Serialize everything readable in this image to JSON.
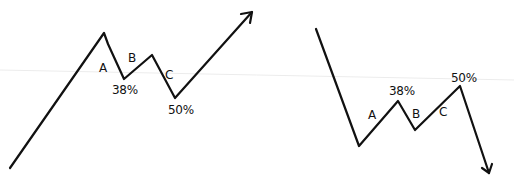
{
  "colors": {
    "ink": "#111111",
    "background": "#ffffff",
    "guide_line": "#e6e6e6"
  },
  "diagrams": [
    {
      "name": "bullish-abc-correction",
      "direction": "up",
      "labels": {
        "a": "A",
        "b": "B",
        "c": "C",
        "retrace_1": "38%",
        "retrace_2": "50%"
      }
    },
    {
      "name": "bearish-abc-correction",
      "direction": "down",
      "labels": {
        "a": "A",
        "b": "B",
        "c": "C",
        "retrace_1": "38%",
        "retrace_2": "50%"
      }
    }
  ]
}
